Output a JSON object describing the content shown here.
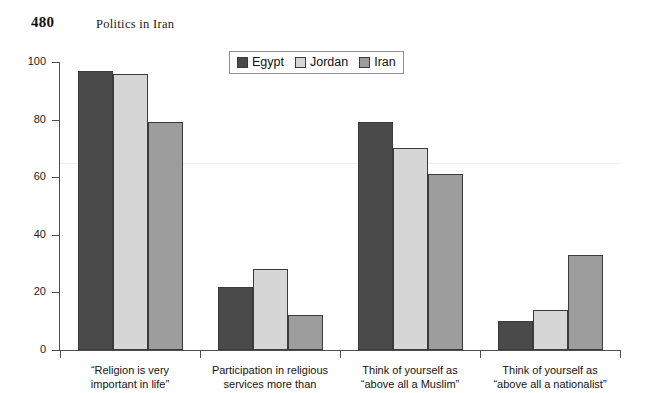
{
  "running_head": {
    "page_number": "480",
    "title": "Politics in Iran"
  },
  "chart_data": {
    "type": "bar",
    "title": "",
    "xlabel": "",
    "ylabel": "",
    "ylim": [
      0,
      100
    ],
    "yticks": [
      "0",
      "20",
      "40",
      "60",
      "80",
      "100"
    ],
    "grid": false,
    "legend_position": "top-center",
    "categories": [
      "“Religion is very\nimportant in life”",
      "Participation in religious\nservices more than",
      "Think of yourself as\n“above all a Muslim”",
      "Think of yourself as\n“above all a nationalist”"
    ],
    "category_lines": [
      [
        "“Religion is very",
        "important in life”"
      ],
      [
        "Participation in religious",
        "services more than"
      ],
      [
        "Think of yourself as",
        "“above all a Muslim”"
      ],
      [
        "Think of yourself as",
        "“above all a nationalist”"
      ]
    ],
    "series": [
      {
        "name": "Egypt",
        "color": "#4a4a4a",
        "values": [
          97,
          22,
          79,
          10
        ]
      },
      {
        "name": "Jordan",
        "color": "#d6d6d6",
        "values": [
          96,
          28,
          70,
          14
        ]
      },
      {
        "name": "Iran",
        "color": "#9d9d9d",
        "values": [
          79,
          12,
          61,
          33
        ]
      }
    ]
  }
}
